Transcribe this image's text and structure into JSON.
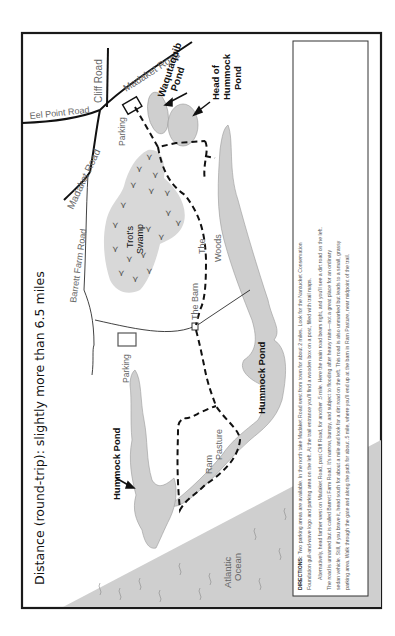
{
  "map": {
    "title": "Distance (round-trip): slightly more than 6.5 miles",
    "colors": {
      "frame": "#1a1a1a",
      "water": "#cfcfcf",
      "trail": "#111111",
      "road": "#111111",
      "label": "#666666"
    },
    "roads": {
      "madaket_road_top": "Madaket Road",
      "madaket_road_mid": "Madaket Road",
      "cliff_road": "Cliff Road",
      "eel_point_road": "Eel Point Road",
      "barrett_farm_road": "Barrett Farm Road"
    },
    "features": {
      "waqutaquib_line1": "Waqutaquib",
      "waqutaquib_line2": "Pond",
      "head_line1": "Head of",
      "head_line2": "Hummock",
      "head_line3": "Pond",
      "trots_line1": "Trot's",
      "trots_line2": "Swamp",
      "the_barn": "The Barn",
      "woods_line1": "The",
      "woods_line2": "Woods",
      "parking_top": "Parking",
      "parking_mid": "Parking",
      "hummock_pond_east": "Hummock Pond",
      "hummock_pond_west": "Hummock Pond",
      "ram_line1": "Ram",
      "ram_line2": "Pasture",
      "ocean_line1": "Atlantic",
      "ocean_line2": "Ocean"
    },
    "directions": {
      "heading": "DIRECTIONS:",
      "lines": [
        "Two parking areas are available. In the north take Madaket Road west from town for about 2 miles. Look for the Nantucket Conservation",
        "Foundation gull-and-wave logo and parking area on the left. At the trail entrance you'll find a wooden box on a post, filled with trail maps.",
        "Alternatively, head farther west on Madaket Road, past Cliff Road, for another .5 mile. Here the main road bears right, and you'll see a dirt road on the left.",
        "The road is unnamed but is called Barrett Farm Road. It's narrow, bumpy, and subject to flooding after heavy rains—not a great place for an ordinary",
        "sedan vehicle. Still, if you brave it, head south for about a mile and look for a dirt road on the left. This road is also unmarked but leads to a small, grassy",
        "parking area. Walk through the gate and along the path for about .5 mile, where you'll end up at the barn in Ram Pasture, near midpoint of the trail."
      ]
    }
  }
}
